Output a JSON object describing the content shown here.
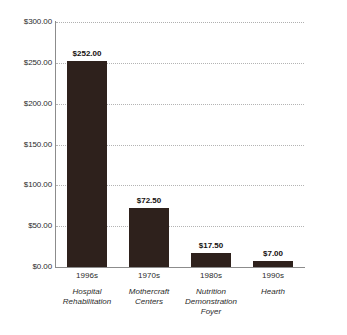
{
  "chart_data": {
    "type": "bar",
    "title": "",
    "xlabel": "",
    "ylabel": "",
    "ylim": [
      0,
      300
    ],
    "grid": true,
    "legend": false,
    "categories": [
      "1996s",
      "1970s",
      "1980s",
      "1990s"
    ],
    "category_names": [
      "Hospital Rehabilitation",
      "Mothercraft Centers",
      "Nutrition Demonstration Foyer",
      "Hearth"
    ],
    "values": [
      252.0,
      72.5,
      17.5,
      7.0
    ],
    "value_labels": [
      "$252.00",
      "$72.50",
      "$17.50",
      "$7.00"
    ],
    "ytick_values": [
      300,
      250,
      200,
      150,
      100,
      50,
      0
    ],
    "ytick_labels": [
      "$300.00",
      "$250.00",
      "$200.00",
      "$150.00",
      "$100.00",
      "$50.00",
      "$0.00"
    ],
    "bars": [
      {
        "category": "1996s",
        "value": 252.0,
        "value_label": "$252.00",
        "name_lines": [
          "Hospital",
          "Rehabilitation"
        ]
      },
      {
        "category": "1970s",
        "value": 72.5,
        "value_label": "$72.50",
        "name_lines": [
          "Mothercraft",
          "Centers"
        ]
      },
      {
        "category": "1980s",
        "value": 17.5,
        "value_label": "$17.50",
        "name_lines": [
          "Nutrition",
          "Demonstration",
          "Foyer"
        ]
      },
      {
        "category": "1990s",
        "value": 7.0,
        "value_label": "$7.00",
        "name_lines": [
          "Hearth"
        ]
      }
    ],
    "colors": {
      "bar": "#2e211c",
      "axis": "#8c8c8c",
      "gridline": "#b4b4b4",
      "text": "#2b2b2b",
      "value_label": "#15100e",
      "background": "#ffffff"
    }
  }
}
